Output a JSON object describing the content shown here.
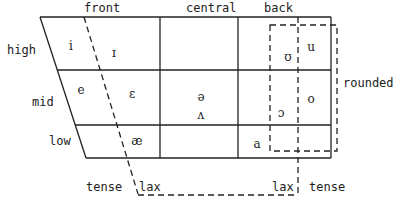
{
  "columns": {
    "front": "front",
    "central": "central",
    "back": "back"
  },
  "rows": {
    "high": "high",
    "mid": "mid",
    "low": "low"
  },
  "annotations": {
    "rounded": "rounded",
    "tense_left": "tense",
    "lax_left": "lax",
    "lax_right": "lax",
    "tense_right": "tense"
  },
  "vowels": {
    "i": "i",
    "ɪ": "ɪ",
    "e": "e",
    "ɛ": "ɛ",
    "æ": "æ",
    "ə": "ə",
    "ʌ": "ʌ",
    "a": "a",
    "ʊ": "ʊ",
    "u": "u",
    "ɔ": "ɔ",
    "o": "o"
  },
  "colors": {
    "ink": "#222222",
    "background": "#ffffff"
  }
}
